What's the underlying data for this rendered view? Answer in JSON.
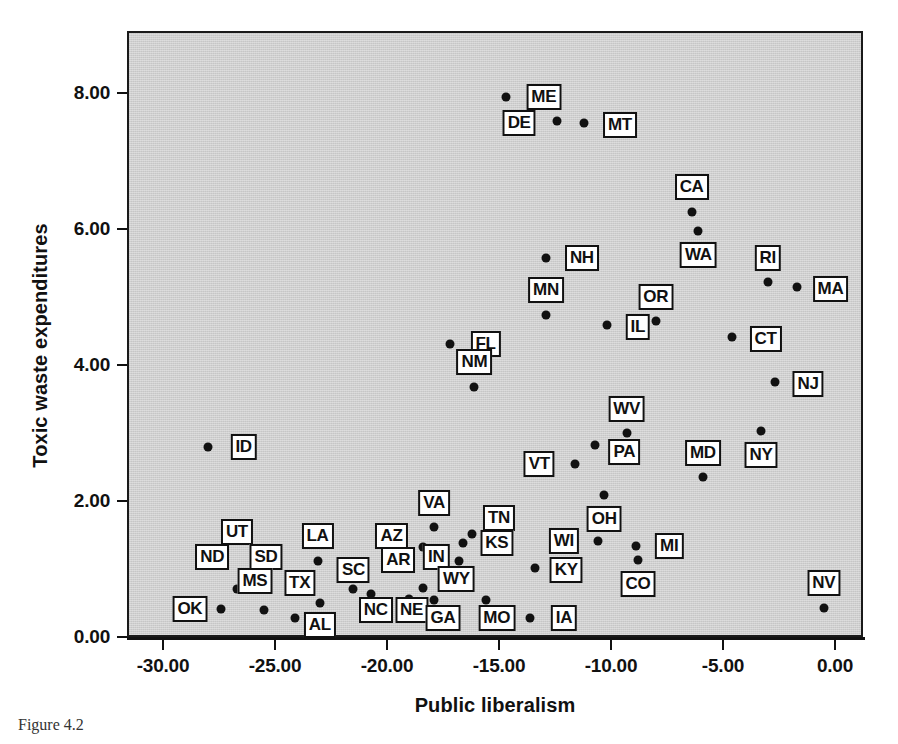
{
  "chart_data": {
    "type": "scatter",
    "title": "",
    "xlabel": "Public liberalism",
    "ylabel": "Toxic waste expenditures",
    "xlim": [
      -31.4,
      1.4
    ],
    "ylim": [
      -0.25,
      8.65
    ],
    "xticks": [
      "-30.00",
      "-25.00",
      "-20.00",
      "-15.00",
      "-10.00",
      "-5.00",
      "0.00"
    ],
    "xtick_values": [
      -30,
      -25,
      -20,
      -15,
      -10,
      -5,
      0
    ],
    "yticks": [
      "0.00",
      "2.00",
      "4.00",
      "6.00",
      "8.00"
    ],
    "ytick_values": [
      0,
      2,
      4,
      6,
      8
    ],
    "grid": false,
    "legend": null,
    "point_color": "#111111",
    "panel_color": "#cfcfcf",
    "points": [
      {
        "label": "ME",
        "x": -14.7,
        "y": 7.94,
        "lx": -13.0,
        "ly": 7.94
      },
      {
        "label": "DE",
        "x": -12.4,
        "y": 7.59,
        "lx": -14.1,
        "ly": 7.56
      },
      {
        "label": "MT",
        "x": -11.2,
        "y": 7.56,
        "lx": -9.6,
        "ly": 7.53
      },
      {
        "label": "CA",
        "x": -6.4,
        "y": 6.25,
        "lx": -6.4,
        "ly": 6.62
      },
      {
        "label": "WA",
        "x": -6.1,
        "y": 5.97,
        "lx": -6.1,
        "ly": 5.62
      },
      {
        "label": "NH",
        "x": -12.9,
        "y": 5.57,
        "lx": -11.3,
        "ly": 5.57
      },
      {
        "label": "RI",
        "x": -3.0,
        "y": 5.22,
        "lx": -3.0,
        "ly": 5.57
      },
      {
        "label": "MA",
        "x": -1.7,
        "y": 5.15,
        "lx": -0.2,
        "ly": 5.12
      },
      {
        "label": "MN",
        "x": -12.9,
        "y": 4.74,
        "lx": -12.9,
        "ly": 5.1
      },
      {
        "label": "OR",
        "x": -8.0,
        "y": 4.65,
        "lx": -8.0,
        "ly": 5.0
      },
      {
        "label": "IL",
        "x": -10.2,
        "y": 4.59,
        "lx": -8.8,
        "ly": 4.56
      },
      {
        "label": "CT",
        "x": -4.6,
        "y": 4.41,
        "lx": -3.1,
        "ly": 4.38
      },
      {
        "label": "FL",
        "x": -17.2,
        "y": 4.31,
        "lx": -15.6,
        "ly": 4.31
      },
      {
        "label": "NJ",
        "x": -2.7,
        "y": 3.75,
        "lx": -1.2,
        "ly": 3.72
      },
      {
        "label": "NM",
        "x": -16.1,
        "y": 3.68,
        "lx": -16.1,
        "ly": 4.04
      },
      {
        "label": "WV",
        "x": -9.3,
        "y": 3.0,
        "lx": -9.3,
        "ly": 3.35
      },
      {
        "label": "NY",
        "x": -3.3,
        "y": 3.03,
        "lx": -3.3,
        "ly": 2.67
      },
      {
        "label": "PA",
        "x": -10.7,
        "y": 2.82,
        "lx": -9.4,
        "ly": 2.72
      },
      {
        "label": "ID",
        "x": -28.0,
        "y": 2.79,
        "lx": -26.4,
        "ly": 2.79
      },
      {
        "label": "VT",
        "x": -11.6,
        "y": 2.54,
        "lx": -13.2,
        "ly": 2.54
      },
      {
        "label": "MD",
        "x": -5.9,
        "y": 2.35,
        "lx": -5.9,
        "ly": 2.71
      },
      {
        "label": "OH",
        "x": -10.3,
        "y": 2.09,
        "lx": -10.3,
        "ly": 1.73
      },
      {
        "label": "VA",
        "x": -17.9,
        "y": 1.62,
        "lx": -17.9,
        "ly": 1.97
      },
      {
        "label": "TN",
        "x": -16.2,
        "y": 1.52,
        "lx": -15.0,
        "ly": 1.75
      },
      {
        "label": "AZ",
        "x": -18.4,
        "y": 1.32,
        "lx": -19.8,
        "ly": 1.48
      },
      {
        "label": "KS",
        "x": -16.6,
        "y": 1.38,
        "lx": -15.1,
        "ly": 1.38
      },
      {
        "label": "UT",
        "x": -28.1,
        "y": 1.26,
        "lx": -26.7,
        "ly": 1.55
      },
      {
        "label": "LA",
        "x": -23.1,
        "y": 1.12,
        "lx": -23.1,
        "ly": 1.49
      },
      {
        "label": "MI",
        "x": -8.9,
        "y": 1.34,
        "lx": -7.4,
        "ly": 1.34
      },
      {
        "label": "WI",
        "x": -10.6,
        "y": 1.41,
        "lx": -12.1,
        "ly": 1.41
      },
      {
        "label": "ND",
        "x": -28.1,
        "y": 1.26,
        "lx": -27.8,
        "ly": 1.17
      },
      {
        "label": "IN",
        "x": -16.8,
        "y": 1.12,
        "lx": -17.8,
        "ly": 1.18
      },
      {
        "label": "AR",
        "x": -18.1,
        "y": 1.1,
        "lx": -19.5,
        "ly": 1.13
      },
      {
        "label": "SD",
        "x": -25.5,
        "y": 0.4,
        "lx": -25.4,
        "ly": 1.17
      },
      {
        "label": "SC",
        "x": -21.5,
        "y": 0.71,
        "lx": -21.5,
        "ly": 0.99
      },
      {
        "label": "KY",
        "x": -13.4,
        "y": 1.02,
        "lx": -12.0,
        "ly": 0.99
      },
      {
        "label": "CO",
        "x": -8.8,
        "y": 1.13,
        "lx": -8.8,
        "ly": 0.78
      },
      {
        "label": "WY",
        "x": -18.4,
        "y": 0.72,
        "lx": -16.9,
        "ly": 0.86
      },
      {
        "label": "MS",
        "x": -26.7,
        "y": 0.71,
        "lx": -25.9,
        "ly": 0.82
      },
      {
        "label": "TX",
        "x": -23.0,
        "y": 0.5,
        "lx": -23.9,
        "ly": 0.79
      },
      {
        "label": "NC",
        "x": -20.7,
        "y": 0.63,
        "lx": -20.5,
        "ly": 0.39
      },
      {
        "label": "NE",
        "x": -19.0,
        "y": 0.56,
        "lx": -18.9,
        "ly": 0.39
      },
      {
        "label": "GA",
        "x": -17.9,
        "y": 0.54,
        "lx": -17.5,
        "ly": 0.28
      },
      {
        "label": "MO",
        "x": -15.6,
        "y": 0.54,
        "lx": -15.1,
        "ly": 0.28
      },
      {
        "label": "IA",
        "x": -13.6,
        "y": 0.28,
        "lx": -12.1,
        "ly": 0.28
      },
      {
        "label": "AL",
        "x": -24.1,
        "y": 0.28,
        "lx": -23.0,
        "ly": 0.18
      },
      {
        "label": "OK",
        "x": -27.4,
        "y": 0.41,
        "lx": -28.8,
        "ly": 0.41
      },
      {
        "label": "NV",
        "x": -0.5,
        "y": 0.43,
        "lx": -0.5,
        "ly": 0.79
      }
    ]
  },
  "caption": "Figure 4.2"
}
